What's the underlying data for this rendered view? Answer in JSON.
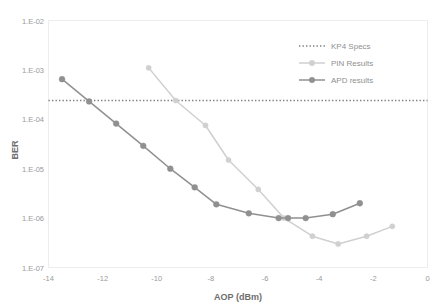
{
  "chart_data": {
    "type": "line",
    "title": "",
    "xlabel": "AOP (dBm)",
    "ylabel": "BER",
    "xlim": [
      -14,
      0
    ],
    "ylim": [
      1e-07,
      0.01
    ],
    "yscale": "log",
    "grid": false,
    "legend_position": "top-right",
    "xticks": [
      -14,
      -12,
      -10,
      -8,
      -6,
      -4,
      -2,
      0
    ],
    "xticklabels": [
      "-14",
      "-12",
      "-10",
      "-8",
      "-6",
      "-4",
      "-2",
      "0"
    ],
    "yticks": [
      0.01,
      0.001,
      0.0001,
      1e-05,
      1e-06,
      1e-07
    ],
    "yticklabels": [
      "1.E-02",
      "1.E-03",
      "1.E-04",
      "1.E-05",
      "1.E-06",
      "1.E-07"
    ],
    "series": [
      {
        "name": "KP4 Specs",
        "style": "dotted-horizontal-line",
        "color": "#7f7f7f",
        "value": 0.00024,
        "x": [
          -14,
          0
        ],
        "values": [
          0.00024,
          0.00024
        ]
      },
      {
        "name": "PIN Results",
        "style": "line-markers",
        "color": "#d0d0d0",
        "x": [
          -10.3,
          -9.3,
          -8.2,
          -7.35,
          -6.25,
          -5.3,
          -4.25,
          -3.3,
          -2.25,
          -1.3
        ],
        "values": [
          0.0011,
          0.00024,
          7.5e-05,
          1.5e-05,
          3.8e-06,
          1e-06,
          4.3e-07,
          3e-07,
          4.3e-07,
          6.8e-07
        ]
      },
      {
        "name": "APD results",
        "style": "line-markers",
        "color": "#909090",
        "x": [
          -13.5,
          -12.5,
          -11.5,
          -10.5,
          -9.5,
          -8.6,
          -7.8,
          -6.6,
          -5.5,
          -5.15,
          -4.5,
          -3.5,
          -2.5
        ],
        "values": [
          0.00065,
          0.00023,
          8.2e-05,
          2.9e-05,
          1e-05,
          4.2e-06,
          1.9e-06,
          1.25e-06,
          1e-06,
          1e-06,
          1e-06,
          1.2e-06,
          2e-06
        ]
      }
    ]
  },
  "legend": {
    "items": [
      {
        "label": "KP4 Specs",
        "marker": "dotted-line-swatch",
        "color": "#7f7f7f"
      },
      {
        "label": "PIN Results",
        "marker": "line-circle-swatch",
        "color": "#d0d0d0"
      },
      {
        "label": "APD results",
        "marker": "line-circle-swatch",
        "color": "#909090"
      }
    ]
  },
  "axes": {
    "x_title": "AOP (dBm)",
    "y_title": "BER"
  }
}
